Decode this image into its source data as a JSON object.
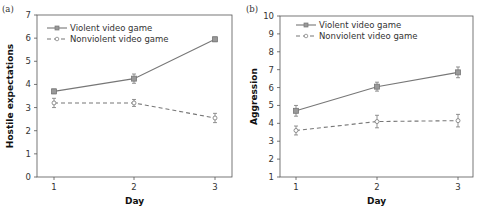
{
  "chart_data": [
    {
      "type": "line",
      "panel_label": "(a)",
      "title": "",
      "xlabel": "Day",
      "ylabel": "Hostile expectations",
      "x": [
        1,
        2,
        3
      ],
      "xticks": [
        "1",
        "2",
        "3"
      ],
      "yticks": [
        "0",
        "1",
        "2",
        "3",
        "4",
        "5",
        "6",
        "7"
      ],
      "ylim": [
        0,
        7
      ],
      "grid": false,
      "legend_position": "upper left",
      "series": [
        {
          "name": "Violent video game",
          "style": "solid",
          "marker": "square",
          "values": [
            3.7,
            4.25,
            5.95
          ],
          "error": [
            0.1,
            0.2,
            0.1
          ]
        },
        {
          "name": "Nonviolent video game",
          "style": "dashed",
          "marker": "circle",
          "values": [
            3.2,
            3.2,
            2.55
          ],
          "error": [
            0.2,
            0.15,
            0.2
          ]
        }
      ]
    },
    {
      "type": "line",
      "panel_label": "(b)",
      "title": "",
      "xlabel": "Day",
      "ylabel": "Aggression",
      "x": [
        1,
        2,
        3
      ],
      "xticks": [
        "1",
        "2",
        "3"
      ],
      "yticks": [
        "1",
        "2",
        "3",
        "4",
        "5",
        "6",
        "7",
        "8",
        "9",
        "10"
      ],
      "ylim": [
        1,
        10
      ],
      "grid": false,
      "legend_position": "upper left",
      "series": [
        {
          "name": "Violent video game",
          "style": "solid",
          "marker": "square",
          "values": [
            4.7,
            6.05,
            6.85
          ],
          "error": [
            0.3,
            0.25,
            0.3
          ]
        },
        {
          "name": "Nonviolent video game",
          "style": "dashed",
          "marker": "circle",
          "values": [
            3.6,
            4.1,
            4.15
          ],
          "error": [
            0.25,
            0.35,
            0.35
          ]
        }
      ]
    }
  ],
  "panel_a": {
    "label": "(a)",
    "xlabel": "Day",
    "ylabel": "Hostile expectations",
    "legend": [
      "Violent video game",
      "Nonviolent video game"
    ]
  },
  "panel_b": {
    "label": "(b)",
    "xlabel": "Day",
    "ylabel": "Aggression",
    "legend": [
      "Violent video game",
      "Nonviolent video game"
    ]
  },
  "colors": {
    "line": "#777777",
    "axis": "#555555"
  }
}
